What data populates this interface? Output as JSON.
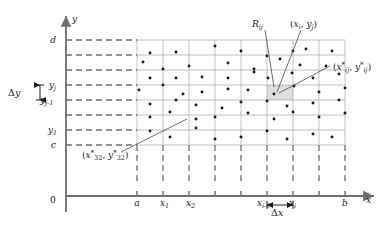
{
  "figure": {
    "name": "riemann-sum-partition-rectangle",
    "colors": {
      "axis": "#6d6d6d",
      "grid": "#9a9a9a",
      "dash": "#6d6d6d",
      "dot": "#1a1a1a",
      "leader": "#5a5a5a",
      "highlight": "#d9d9d9",
      "text": "#1a1a1a"
    }
  },
  "axes": {
    "x_label": "x",
    "y_label": "y",
    "origin_label": "0"
  },
  "x_ticks": [
    {
      "label": "a",
      "x": 137
    },
    {
      "label": "x_1",
      "x": 163
    },
    {
      "label": "x_2",
      "x": 189
    },
    {
      "label": "",
      "x": 215
    },
    {
      "label": "",
      "x": 241
    },
    {
      "label": "x_{i-1}",
      "x": 267
    },
    {
      "label": "x_i",
      "x": 293
    },
    {
      "label": "",
      "x": 319
    },
    {
      "label": "b",
      "x": 345
    }
  ],
  "y_ticks": [
    {
      "label": "d",
      "y": 40
    },
    {
      "label": "",
      "y": 55
    },
    {
      "label": "",
      "y": 70
    },
    {
      "label": "y_j",
      "y": 85
    },
    {
      "label": "y_{j-1}",
      "y": 100
    },
    {
      "label": "",
      "y": 115
    },
    {
      "label": "y_1",
      "y": 130
    },
    {
      "label": "c",
      "y": 145
    }
  ],
  "x_tick_text": {
    "a": "a",
    "x1_base": "x",
    "x1_sub": "1",
    "x2_base": "x",
    "x2_sub": "2",
    "xim1_base": "x",
    "xim1_sub": "i-1",
    "xi_base": "x",
    "xi_sub": "i",
    "b": "b"
  },
  "y_tick_text": {
    "d": "d",
    "yj_base": "y",
    "yj_sub": "j",
    "yjm1_base": "y",
    "yjm1_sub": "j-1",
    "y1_base": "y",
    "y1_sub": "1",
    "c": "c"
  },
  "annotations": {
    "delta_x": {
      "delta": "Δ",
      "var": "x"
    },
    "delta_y": {
      "delta": "Δ",
      "var": "y"
    },
    "Rij": {
      "base": "R",
      "sub": "ij"
    },
    "corner_point": {
      "open": "(",
      "x": "x",
      "xsub": "i",
      "comma": ", ",
      "y": "y",
      "ysub": "j",
      "close": ")"
    },
    "sample_point_ij": {
      "open": "(",
      "x": "x",
      "xstar": "*",
      "xsub": "ij",
      "comma": ", ",
      "y": "y",
      "ystar": "*",
      "ysub": "ij",
      "close": ")"
    },
    "sample_point_32": {
      "open": "(",
      "x": "x",
      "xstar": "*",
      "xsub": "32",
      "comma": ", ",
      "y": "y",
      "ystar": "*",
      "ysub": "32",
      "close": ")"
    }
  },
  "grid": {
    "columns": 8,
    "rows": 7,
    "left": 137,
    "right": 345,
    "top": 40,
    "bottom": 145,
    "highlight_cell": {
      "col": 5,
      "row": 3
    }
  },
  "chart_data": {
    "type": "scatter",
    "title": "",
    "xlabel": "x",
    "ylabel": "y",
    "xlim": [
      137,
      345
    ],
    "ylim": [
      40,
      145
    ],
    "grid": true,
    "points": [
      [
        150,
        53
      ],
      [
        176,
        52
      ],
      [
        215,
        46
      ],
      [
        241,
        51
      ],
      [
        267,
        56
      ],
      [
        293,
        51
      ],
      [
        306,
        49
      ],
      [
        332,
        51
      ],
      [
        143,
        62
      ],
      [
        163,
        69
      ],
      [
        189,
        66
      ],
      [
        228,
        63
      ],
      [
        254,
        69
      ],
      [
        280,
        59
      ],
      [
        300,
        65
      ],
      [
        326,
        66
      ],
      [
        150,
        78
      ],
      [
        176,
        78
      ],
      [
        202,
        77
      ],
      [
        228,
        78
      ],
      [
        254,
        72
      ],
      [
        268,
        78
      ],
      [
        292,
        73
      ],
      [
        313,
        78
      ],
      [
        339,
        74
      ],
      [
        139,
        90
      ],
      [
        163,
        85
      ],
      [
        183,
        94
      ],
      [
        202,
        92
      ],
      [
        228,
        89
      ],
      [
        248,
        90
      ],
      [
        274,
        94
      ],
      [
        294,
        86
      ],
      [
        319,
        92
      ],
      [
        345,
        88
      ],
      [
        150,
        104
      ],
      [
        176,
        100
      ],
      [
        196,
        105
      ],
      [
        222,
        108
      ],
      [
        241,
        102
      ],
      [
        267,
        101
      ],
      [
        287,
        106
      ],
      [
        313,
        103
      ],
      [
        339,
        100
      ],
      [
        150,
        117
      ],
      [
        170,
        112
      ],
      [
        196,
        119
      ],
      [
        215,
        117
      ],
      [
        248,
        113
      ],
      [
        274,
        119
      ],
      [
        293,
        112
      ],
      [
        319,
        117
      ],
      [
        345,
        113
      ],
      [
        150,
        131
      ],
      [
        170,
        137
      ],
      [
        196,
        128
      ],
      [
        215,
        139
      ],
      [
        241,
        137
      ],
      [
        267,
        131
      ],
      [
        287,
        139
      ],
      [
        313,
        134
      ],
      [
        332,
        137
      ]
    ]
  }
}
